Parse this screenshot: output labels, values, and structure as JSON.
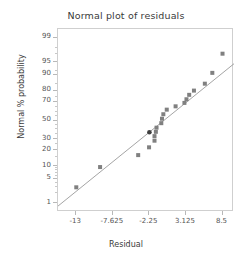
{
  "chart_data": {
    "type": "scatter",
    "title": "Normal plot of residuals",
    "xlabel": "Residual",
    "ylabel": "Normal % probability",
    "grid": false,
    "legend": "none",
    "xlim": [
      -15.6875,
      10.1875
    ],
    "ylim_percent": [
      0.5,
      99.5
    ],
    "y_scale": "normal-probability",
    "xticks": [
      -13,
      -7.625,
      -2.25,
      3.125,
      8.5
    ],
    "xticklabels": [
      "-13",
      "-7.625",
      "-2.25",
      "3.125",
      "8.5"
    ],
    "yticks": [
      1,
      5,
      10,
      20,
      30,
      50,
      70,
      80,
      90,
      95,
      99
    ],
    "yticklabels": [
      "1",
      "5",
      "10",
      "20",
      "30",
      "50",
      "70",
      "80",
      "90",
      "95",
      "99"
    ],
    "y_minor_ticks": [
      2,
      3,
      4,
      6,
      7,
      8,
      9,
      15,
      25,
      35,
      40,
      45,
      55,
      60,
      65,
      75,
      85,
      92,
      97,
      98
    ],
    "series": [
      {
        "name": "residual points",
        "marker": "square",
        "color": "#808080",
        "points": [
          {
            "x": -13.0,
            "y_percent": 3.0
          },
          {
            "x": -9.5,
            "y_percent": 9.5
          },
          {
            "x": -3.9,
            "y_percent": 16.5
          },
          {
            "x": -2.3,
            "y_percent": 22.5
          },
          {
            "x": -1.5,
            "y_percent": 28.5
          },
          {
            "x": -1.5,
            "y_percent": 33.0
          },
          {
            "x": -1.3,
            "y_percent": 37.5
          },
          {
            "x": -1.2,
            "y_percent": 42.0
          },
          {
            "x": -0.5,
            "y_percent": 47.0
          },
          {
            "x": -0.4,
            "y_percent": 52.0
          },
          {
            "x": -0.2,
            "y_percent": 57.0
          },
          {
            "x": 0.3,
            "y_percent": 62.0
          },
          {
            "x": 1.6,
            "y_percent": 65.5
          },
          {
            "x": 2.9,
            "y_percent": 69.0
          },
          {
            "x": 3.2,
            "y_percent": 72.5
          },
          {
            "x": 3.6,
            "y_percent": 76.5
          },
          {
            "x": 4.3,
            "y_percent": 80.0
          },
          {
            "x": 5.9,
            "y_percent": 85.0
          },
          {
            "x": 7.0,
            "y_percent": 91.0
          },
          {
            "x": 8.5,
            "y_percent": 97.0
          }
        ]
      },
      {
        "name": "highlighted point",
        "marker": "square",
        "color": "#3f3f3f",
        "points": [
          {
            "x": -2.25,
            "y_percent": 37.0
          }
        ]
      }
    ],
    "reference_line": {
      "name": "normal reference line",
      "color": "#9a9a9a",
      "x_start": -15.6875,
      "y_percent_start": 0.8,
      "x_end": 10.1875,
      "y_percent_end": 94.5
    }
  },
  "colors": {
    "marker": "#808080",
    "highlight": "#3f3f3f",
    "line": "#9a9a9a",
    "frame": "#cfcfcf",
    "text": "#3a3a3a",
    "tick_text": "#555555"
  }
}
